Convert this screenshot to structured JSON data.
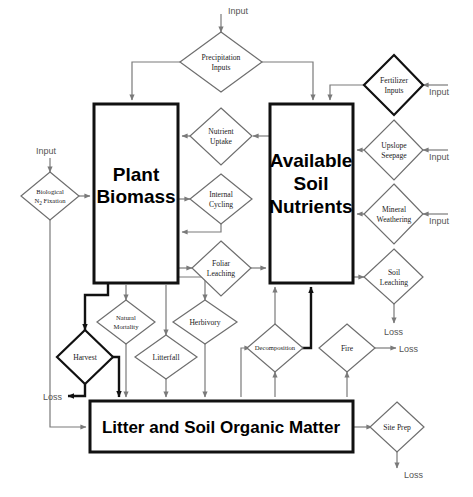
{
  "diagram": {
    "stocks": [
      {
        "id": "plant_biomass",
        "label_line1": "Plant",
        "label_line2": "Biomass"
      },
      {
        "id": "available_soil_nutrients",
        "label_line1": "Available",
        "label_line2": "Soil",
        "label_line3": "Nutrients"
      },
      {
        "id": "litter_som",
        "label": "Litter and Soil Organic Matter"
      }
    ],
    "processes": [
      {
        "id": "precipitation_inputs",
        "line1": "Precipitation",
        "line2": "Inputs"
      },
      {
        "id": "biological_n2_fixation",
        "line1": "Biological",
        "line2": "N",
        "sub": "2",
        "line2b": " Fixation"
      },
      {
        "id": "fertilizer_inputs",
        "line1": "Fertilizer",
        "line2": "Inputs"
      },
      {
        "id": "upslope_seepage",
        "line1": "Upslope",
        "line2": "Seepage"
      },
      {
        "id": "mineral_weathering",
        "line1": "Mineral",
        "line2": "Weathering"
      },
      {
        "id": "soil_leaching",
        "line1": "Soil",
        "line2": "Leaching"
      },
      {
        "id": "nutrient_uptake",
        "line1": "Nutrient",
        "line2": "Uptake"
      },
      {
        "id": "internal_cycling",
        "line1": "Internal",
        "line2": "Cycling"
      },
      {
        "id": "foliar_leaching",
        "line1": "Foliar",
        "line2": "Leaching"
      },
      {
        "id": "natural_mortality",
        "line1": "Natural",
        "line2": "Mortality"
      },
      {
        "id": "herbivory",
        "line1": "Herbivory",
        "line2": ""
      },
      {
        "id": "litterfall",
        "line1": "Litterfall",
        "line2": ""
      },
      {
        "id": "harvest",
        "line1": "Harvest",
        "line2": ""
      },
      {
        "id": "decomposition",
        "line1": "Decomposition",
        "line2": ""
      },
      {
        "id": "fire",
        "line1": "Fire",
        "line2": ""
      },
      {
        "id": "site_prep",
        "line1": "Site Prep",
        "line2": ""
      }
    ],
    "io_labels": {
      "input_precipitation": "Input",
      "input_n2fixation": "Input",
      "input_fertilizer": "Input",
      "input_upslope": "Input",
      "input_mineral": "Input",
      "loss_soil_leaching": "Loss",
      "loss_fire": "Loss",
      "loss_harvest": "Loss",
      "loss_site_prep": "Loss"
    },
    "colors": {
      "stroke_strong": "#111111",
      "stroke_light": "#7a7a7a",
      "background": "#ffffff",
      "text": "#000000"
    }
  }
}
